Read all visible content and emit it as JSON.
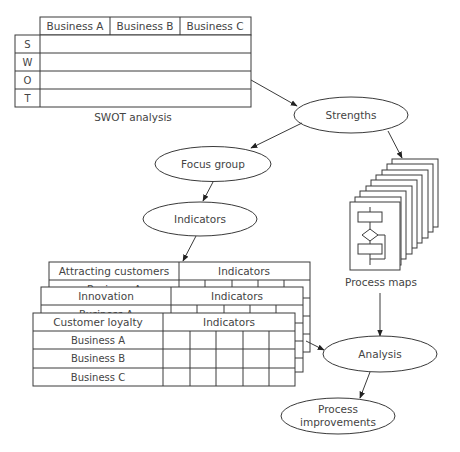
{
  "colors": {
    "stroke": "#3a3a3a",
    "text": "#444444",
    "background": "#ffffff"
  },
  "swot": {
    "title": "SWOT analysis",
    "columns": [
      "Business A",
      "Business B",
      "Business C"
    ],
    "rows": [
      "S",
      "W",
      "O",
      "T"
    ]
  },
  "nodes": {
    "strengths": "Strengths",
    "focus_group": "Focus group",
    "indicators": "Indicators",
    "process_maps": "Process maps",
    "analysis": "Analysis",
    "process_improvements_line1": "Process",
    "process_improvements_line2": "improvements"
  },
  "indicator_tables": [
    {
      "title": "Attracting customers",
      "header_right": "Indicators",
      "rows": [
        "Business A",
        "Business B",
        "Business C"
      ]
    },
    {
      "title": "Innovation",
      "header_right": "Indicators",
      "rows": [
        "Business A",
        "Business B",
        "Business C"
      ]
    },
    {
      "title": "Customer loyalty",
      "header_right": "Indicators",
      "rows": [
        "Business A",
        "Business B",
        "Business C"
      ]
    }
  ]
}
